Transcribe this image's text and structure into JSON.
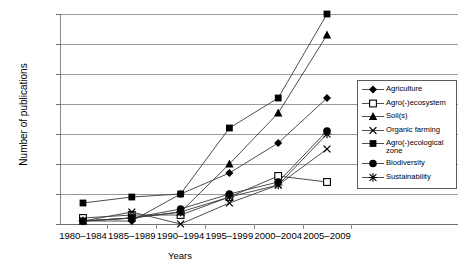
{
  "chart_data": {
    "type": "line",
    "title": "",
    "xlabel": "Years",
    "ylabel": "Number of publications",
    "categories": [
      "1980–1984",
      "1985–1989",
      "1990–1994",
      "1995–1999",
      "2000–2004",
      "2005–2009"
    ],
    "ylim": [
      0,
      70
    ],
    "yticks": [
      0,
      10,
      20,
      30,
      40,
      50,
      60,
      70
    ],
    "grid": true,
    "legend_position": "right",
    "series": [
      {
        "name": "Agriculture",
        "marker": "diamond",
        "values": [
          1,
          1,
          10,
          17,
          27,
          42
        ]
      },
      {
        "name": "Agro(-)ecosystem",
        "marker": "open-square",
        "values": [
          2,
          3,
          3,
          9,
          16,
          14
        ]
      },
      {
        "name": "Soil(s)",
        "marker": "triangle",
        "values": [
          1,
          2,
          4,
          20,
          37,
          63
        ]
      },
      {
        "name": "Organic farming",
        "marker": "x",
        "values": [
          1,
          4,
          0,
          7,
          13,
          25
        ]
      },
      {
        "name": "Agro(-)ecological zone",
        "marker": "square",
        "values": [
          7,
          9,
          10,
          32,
          42,
          70
        ]
      },
      {
        "name": "Biodiversity",
        "marker": "circle",
        "values": [
          1,
          2,
          5,
          10,
          14,
          31
        ]
      },
      {
        "name": "Sustainability",
        "marker": "asterisk",
        "values": [
          1,
          2,
          4,
          9,
          13,
          30
        ]
      }
    ]
  },
  "axis": {
    "y_tick_labels": [
      "0",
      "10",
      "20",
      "30",
      "40",
      "50",
      "60",
      "70"
    ],
    "y_title": "Number of publications",
    "x_title": "Years",
    "x_tick_labels": [
      "1980–1984",
      "1985–1989",
      "1990–1994",
      "1995–1999",
      "2000–2004",
      "2005–2009"
    ]
  },
  "legend": {
    "items": [
      {
        "label": "Agriculture",
        "marker": "diamond-marker-icon"
      },
      {
        "label": "Agro(-)ecosystem",
        "marker": "open-square-marker-icon"
      },
      {
        "label": "Soil(s)",
        "marker": "triangle-marker-icon"
      },
      {
        "label": "Organic farming",
        "marker": "x-marker-icon"
      },
      {
        "label": "Agro(-)ecological zone",
        "marker": "filled-square-marker-icon"
      },
      {
        "label": "Biodiversity",
        "marker": "filled-circle-marker-icon"
      },
      {
        "label": "Sustainability",
        "marker": "asterisk-marker-icon"
      }
    ]
  },
  "colors": {
    "line": "#3a3a3a",
    "marker": "#000000",
    "grid": "#9a9a9a",
    "axis": "#6f6f6f",
    "background": "#ffffff"
  }
}
